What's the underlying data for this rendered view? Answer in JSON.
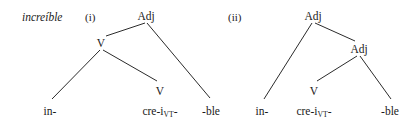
{
  "figure": {
    "word": "increíble",
    "background_color": "#ffffff",
    "line_color": "#2b2b2b",
    "text_color": "#1a1a1a",
    "trees": [
      {
        "enumerator": "(i)",
        "enumerator_x": 85,
        "enumerator_y": 12,
        "nodes": [
          {
            "name": "root-adj",
            "label": "Adj",
            "x": 146,
            "y": 11
          },
          {
            "name": "internal-v",
            "label": "V",
            "x": 101,
            "y": 38
          },
          {
            "name": "preterminal-v",
            "label": "V",
            "x": 160,
            "y": 86
          }
        ],
        "leaves": [
          {
            "name": "leaf-in",
            "label": "in-",
            "sub": "",
            "tail": "",
            "x": 50,
            "y": 106
          },
          {
            "name": "leaf-cre-i",
            "label": "cre-i",
            "sub": "VT",
            "tail": "-",
            "x": 160,
            "y": 106
          },
          {
            "name": "leaf-ble",
            "label": "-ble",
            "sub": "",
            "tail": "",
            "x": 211,
            "y": 106
          }
        ],
        "edges": [
          {
            "name": "edge-root-to-v",
            "x1": 145,
            "y1": 23,
            "x2": 106,
            "y2": 36
          },
          {
            "name": "edge-root-to-ble",
            "x1": 147,
            "y1": 23,
            "x2": 210,
            "y2": 98
          },
          {
            "name": "edge-v-to-in",
            "x1": 100,
            "y1": 50,
            "x2": 52,
            "y2": 99
          },
          {
            "name": "edge-v-to-prev",
            "x1": 103,
            "y1": 50,
            "x2": 157,
            "y2": 81
          }
        ]
      },
      {
        "enumerator": "(ii)",
        "enumerator_x": 228,
        "enumerator_y": 12,
        "nodes": [
          {
            "name": "root-adj",
            "label": "Adj",
            "x": 313,
            "y": 11
          },
          {
            "name": "internal-adj",
            "label": "Adj",
            "x": 359,
            "y": 44
          },
          {
            "name": "preterminal-v",
            "label": "V",
            "x": 314,
            "y": 86
          }
        ],
        "leaves": [
          {
            "name": "leaf-in",
            "label": "in-",
            "sub": "",
            "tail": "",
            "x": 262,
            "y": 106
          },
          {
            "name": "leaf-cre-i",
            "label": "cre-i",
            "sub": "VT",
            "tail": "-",
            "x": 314,
            "y": 106
          },
          {
            "name": "leaf-ble",
            "label": "-ble",
            "sub": "",
            "tail": "",
            "x": 390,
            "y": 106
          }
        ],
        "edges": [
          {
            "name": "edge-root-to-in",
            "x1": 312,
            "y1": 23,
            "x2": 264,
            "y2": 99
          },
          {
            "name": "edge-root-to-adj",
            "x1": 315,
            "y1": 23,
            "x2": 355,
            "y2": 41
          },
          {
            "name": "edge-adj-to-v",
            "x1": 357,
            "y1": 56,
            "x2": 317,
            "y2": 81
          },
          {
            "name": "edge-adj-to-ble",
            "x1": 360,
            "y1": 56,
            "x2": 391,
            "y2": 99
          }
        ]
      }
    ]
  }
}
